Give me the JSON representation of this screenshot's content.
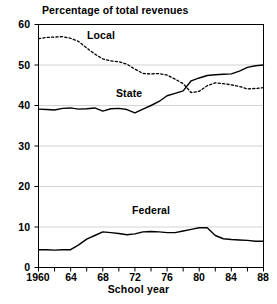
{
  "chart_data": {
    "type": "line",
    "title": "Percentage of total revenues",
    "xlabel": "School year",
    "ylabel": "",
    "xlim": [
      1960,
      1988
    ],
    "ylim": [
      0,
      60
    ],
    "grid": true,
    "legend_position": "inline-labels",
    "x": [
      1960,
      1961,
      1962,
      1963,
      1964,
      1965,
      1966,
      1967,
      1968,
      1969,
      1970,
      1971,
      1972,
      1973,
      1974,
      1975,
      1976,
      1977,
      1978,
      1979,
      1980,
      1981,
      1982,
      1983,
      1984,
      1985,
      1986,
      1987,
      1988
    ],
    "series": [
      {
        "name": "Local",
        "style": "dotted",
        "values": [
          56.5,
          56.8,
          56.9,
          57.0,
          56.6,
          55.8,
          54.2,
          52.7,
          51.5,
          51.0,
          50.8,
          50.2,
          49.0,
          47.9,
          47.8,
          47.9,
          47.5,
          46.5,
          45.4,
          43.2,
          43.5,
          44.9,
          45.6,
          45.4,
          45.1,
          44.7,
          44.1,
          44.2,
          44.4
        ]
      },
      {
        "name": "State",
        "style": "solid",
        "values": [
          39.1,
          39.0,
          38.9,
          39.3,
          39.4,
          39.1,
          39.2,
          39.4,
          38.6,
          39.2,
          39.3,
          39.0,
          38.2,
          39.1,
          40.0,
          41.0,
          42.4,
          43.0,
          43.6,
          46.1,
          46.8,
          47.4,
          47.6,
          47.7,
          47.8,
          48.5,
          49.4,
          49.8,
          50.0
        ]
      },
      {
        "name": "Federal",
        "style": "solid",
        "values": [
          4.4,
          4.4,
          4.3,
          4.4,
          4.4,
          5.6,
          7.0,
          7.9,
          8.8,
          8.6,
          8.4,
          8.1,
          8.3,
          8.8,
          8.9,
          8.8,
          8.6,
          8.6,
          9.0,
          9.4,
          9.8,
          9.8,
          7.9,
          7.1,
          6.9,
          6.8,
          6.7,
          6.5,
          6.5
        ]
      }
    ],
    "y_ticks": [
      0,
      10,
      20,
      30,
      40,
      50,
      60
    ],
    "x_ticks_labeled": [
      "1960",
      "64",
      "68",
      "72",
      "76",
      "80",
      "84",
      "88"
    ],
    "x_ticks_labeled_values": [
      1960,
      1964,
      1968,
      1972,
      1976,
      1980,
      1984,
      1988
    ],
    "x_ticks_minor_values": [
      1962,
      1966,
      1970,
      1974,
      1978,
      1982,
      1986
    ],
    "colors": {
      "axis": "#000000",
      "grid": "#c8c8c8",
      "line": "#000000",
      "background": "#ffffff"
    }
  }
}
